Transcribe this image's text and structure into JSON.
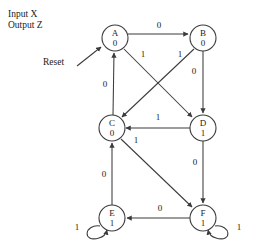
{
  "diagram": {
    "type": "moore-state-diagram",
    "caption": {
      "input_label": "Input X",
      "output_label": "Output Z"
    },
    "reset": {
      "label": "Reset",
      "target_state": "A"
    },
    "colors": {
      "stroke": "#3b3b3b",
      "text": "#1a1a1a",
      "background": "#ffffff"
    },
    "node_radius": 13,
    "states": [
      {
        "id": "A",
        "name": "A",
        "output": "0",
        "cx": 115,
        "cy": 38
      },
      {
        "id": "B",
        "name": "B",
        "output": "0",
        "cx": 203,
        "cy": 38
      },
      {
        "id": "C",
        "name": "C",
        "output": "0",
        "cx": 112,
        "cy": 128
      },
      {
        "id": "D",
        "name": "D",
        "output": "1",
        "cx": 203,
        "cy": 128
      },
      {
        "id": "E",
        "name": "E",
        "output": "1",
        "cx": 112,
        "cy": 218
      },
      {
        "id": "F",
        "name": "F",
        "output": "1",
        "cx": 203,
        "cy": 218
      }
    ],
    "transitions": [
      {
        "from": "A",
        "to": "B",
        "input": "0",
        "label_x": 159,
        "label_y": 26
      },
      {
        "from": "A",
        "to": "D",
        "input": "1",
        "label_x": 143,
        "label_y": 55
      },
      {
        "from": "B",
        "to": "C",
        "input": "1",
        "label_x": 180,
        "label_y": 55
      },
      {
        "from": "B",
        "to": "D",
        "input": "0",
        "label_x": 194,
        "label_y": 72
      },
      {
        "from": "C",
        "to": "A",
        "input": "0",
        "label_x": 105,
        "label_y": 85
      },
      {
        "from": "C",
        "to": "F",
        "input": "1",
        "label_x": 136,
        "label_y": 141
      },
      {
        "from": "D",
        "to": "C",
        "input": "1",
        "label_x": 158,
        "label_y": 118
      },
      {
        "from": "D",
        "to": "F",
        "input": "0",
        "label_x": 195,
        "label_y": 163
      },
      {
        "from": "E",
        "to": "C",
        "input": "0",
        "label_x": 104,
        "label_y": 175
      },
      {
        "from": "E",
        "to": "E",
        "input": "1",
        "label_x": 77,
        "label_y": 228,
        "self_loop": "left"
      },
      {
        "from": "F",
        "to": "E",
        "input": "0",
        "label_x": 160,
        "label_y": 209
      },
      {
        "from": "F",
        "to": "F",
        "input": "1",
        "label_x": 239,
        "label_y": 228,
        "self_loop": "right"
      }
    ]
  }
}
